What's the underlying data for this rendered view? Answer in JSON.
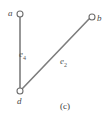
{
  "figure": {
    "caption": "(c)",
    "background_color": "#ffffff",
    "edge_color": "#7d7d7d",
    "node_stroke_color": "#6e6e6e",
    "node_fill_color": "#ffffff",
    "label_color": "#4a4a4a",
    "type": "undirected-graph"
  },
  "nodes": [
    {
      "id": "a",
      "label": "a",
      "x": 20,
      "y": 14,
      "radius": 3
    },
    {
      "id": "b",
      "label": "b",
      "x": 92,
      "y": 17,
      "radius": 3
    },
    {
      "id": "d",
      "label": "d",
      "x": 20,
      "y": 91,
      "radius": 3
    }
  ],
  "edges": [
    {
      "id": "e4",
      "label": "e",
      "subscript": "4",
      "from": "a",
      "to": "d",
      "x1": 20,
      "y1": 17,
      "x2": 20,
      "y2": 88
    },
    {
      "id": "e2",
      "label": "e",
      "subscript": "2",
      "from": "d",
      "to": "b",
      "x1": 22,
      "y1": 89,
      "x2": 89,
      "y2": 19
    }
  ]
}
